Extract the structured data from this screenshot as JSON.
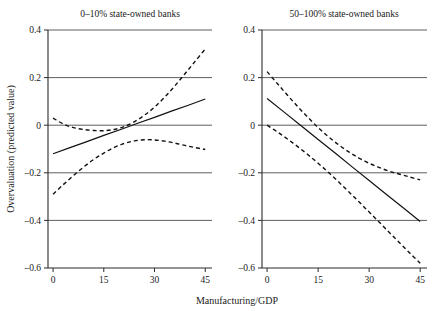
{
  "figure": {
    "background": "#ffffff",
    "ink_color": "#111111",
    "grid_color": "#4d4d4d",
    "width": 438,
    "height": 311
  },
  "axis_titles": {
    "x": "Manufacturing/GDP",
    "y": "Overvaluation (predicted value)"
  },
  "ticks": {
    "x": [
      "0",
      "15",
      "30",
      "45"
    ],
    "y": [
      "0.4",
      "0.2",
      "0",
      "–0.2",
      "–0.4",
      "–0.6"
    ]
  },
  "chart_data": [
    {
      "type": "line",
      "title": "0–10% state-owned banks",
      "xlabel": "Manufacturing/GDP",
      "ylabel": "Overvaluation (predicted value)",
      "xlim": [
        -1.5,
        47
      ],
      "ylim": [
        -0.6,
        0.4
      ],
      "xticks": [
        0,
        15,
        30,
        45
      ],
      "yticks": [
        0.4,
        0.2,
        0,
        -0.2,
        -0.4,
        -0.6
      ],
      "grid": true,
      "legend": "none",
      "series": [
        {
          "name": "Predicted value (fit)",
          "style": "solid",
          "x": [
            0,
            5,
            10,
            15,
            20,
            25,
            30,
            35,
            40,
            45
          ],
          "values": [
            -0.12,
            -0.094,
            -0.069,
            -0.043,
            -0.018,
            0.008,
            0.033,
            0.059,
            0.084,
            0.11
          ]
        },
        {
          "name": "Upper confidence bound",
          "style": "dashed",
          "x": [
            0,
            3,
            6,
            9,
            12,
            15,
            18,
            21,
            24,
            27,
            30,
            33,
            36,
            39,
            42,
            45
          ],
          "values": [
            0.03,
            0.005,
            -0.01,
            -0.018,
            -0.022,
            -0.023,
            -0.018,
            -0.006,
            0.014,
            0.042,
            0.076,
            0.118,
            0.165,
            0.216,
            0.268,
            0.32
          ]
        },
        {
          "name": "Lower confidence bound",
          "style": "dashed",
          "x": [
            0,
            3,
            6,
            9,
            12,
            15,
            18,
            21,
            24,
            27,
            30,
            33,
            36,
            39,
            42,
            45
          ],
          "values": [
            -0.29,
            -0.25,
            -0.212,
            -0.176,
            -0.144,
            -0.117,
            -0.094,
            -0.077,
            -0.066,
            -0.061,
            -0.062,
            -0.067,
            -0.075,
            -0.085,
            -0.094,
            -0.102
          ]
        }
      ]
    },
    {
      "type": "line",
      "title": "50–100% state-owned banks",
      "xlabel": "Manufacturing/GDP",
      "ylabel": "Overvaluation (predicted value)",
      "xlim": [
        -1.5,
        47
      ],
      "ylim": [
        -0.6,
        0.4
      ],
      "xticks": [
        0,
        15,
        30,
        45
      ],
      "yticks": [
        0.4,
        0.2,
        0,
        -0.2,
        -0.4,
        -0.6
      ],
      "grid": true,
      "legend": "none",
      "series": [
        {
          "name": "Predicted value (fit)",
          "style": "solid",
          "x": [
            0,
            5,
            10,
            15,
            20,
            25,
            30,
            35,
            40,
            45
          ],
          "values": [
            0.112,
            0.055,
            -0.002,
            -0.06,
            -0.117,
            -0.175,
            -0.232,
            -0.29,
            -0.347,
            -0.405
          ]
        },
        {
          "name": "Upper confidence bound",
          "style": "dashed",
          "x": [
            0,
            3,
            6,
            9,
            12,
            15,
            18,
            21,
            24,
            27,
            30,
            33,
            36,
            39,
            42,
            45
          ],
          "values": [
            0.225,
            0.175,
            0.126,
            0.078,
            0.033,
            -0.01,
            -0.048,
            -0.082,
            -0.112,
            -0.138,
            -0.16,
            -0.178,
            -0.194,
            -0.206,
            -0.218,
            -0.23
          ]
        },
        {
          "name": "Lower confidence bound",
          "style": "dashed",
          "x": [
            0,
            3,
            6,
            9,
            12,
            15,
            18,
            21,
            24,
            27,
            30,
            33,
            36,
            39,
            42,
            45
          ],
          "values": [
            0.0,
            -0.028,
            -0.058,
            -0.09,
            -0.124,
            -0.16,
            -0.198,
            -0.238,
            -0.28,
            -0.322,
            -0.365,
            -0.408,
            -0.452,
            -0.495,
            -0.538,
            -0.58
          ]
        }
      ]
    }
  ]
}
